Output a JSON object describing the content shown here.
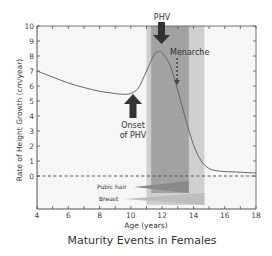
{
  "chart_data": {
    "type": "line",
    "title": "Maturity Events in Females",
    "xlabel": "Age (years)",
    "ylabel": "Rate of Height Growth (cm/year)",
    "xlim": [
      4,
      18
    ],
    "ylim": [
      0,
      10
    ],
    "x_ticks": [
      "4",
      "6",
      "8",
      "10",
      "12",
      "14",
      "16",
      "18"
    ],
    "y_ticks": [
      "0",
      "1",
      "2",
      "3",
      "4",
      "5",
      "6",
      "7",
      "8",
      "9",
      "10"
    ],
    "grid": false,
    "series": [
      {
        "name": "Height growth velocity",
        "x": [
          4,
          5,
          6,
          7,
          8,
          9,
          9.5,
          10,
          10.5,
          11,
          11.5,
          11.8,
          12,
          12.5,
          13,
          13.5,
          14,
          14.5,
          15,
          15.5,
          16,
          17,
          18
        ],
        "y": [
          7.0,
          6.6,
          6.2,
          5.9,
          5.65,
          5.5,
          5.45,
          5.5,
          5.9,
          7.0,
          8.1,
          8.3,
          8.2,
          7.4,
          5.7,
          3.8,
          2.1,
          1.0,
          0.5,
          0.35,
          0.3,
          0.25,
          0.2
        ]
      }
    ],
    "reference_line": {
      "y": 0,
      "style": "dashed"
    },
    "bands": [
      {
        "name": "outer-band",
        "x_start": 11.0,
        "x_end": 14.7,
        "color": "#c8c8c8"
      },
      {
        "name": "inner-band",
        "x_start": 11.3,
        "x_end": 13.7,
        "color": "#9a9a9a"
      }
    ],
    "annotations": [
      {
        "text": "PHV",
        "x": 12.0,
        "y": 8.3,
        "arrow": "down-solid"
      },
      {
        "text": "Menarche",
        "x": 12.9,
        "y": 6.0,
        "arrow": "down-dotted"
      },
      {
        "text": "Onset",
        "text2": "of PHV",
        "x": 10.5,
        "y": 5.5,
        "arrow": "up-solid"
      },
      {
        "text": "Pubic hair",
        "type": "wedge",
        "x_start": 10.2,
        "x_end": 13.7
      },
      {
        "text": "Breast",
        "type": "wedge",
        "x_start": 9.6,
        "x_end": 14.7
      }
    ]
  },
  "labels": {
    "title": "Maturity Events in Females",
    "xlabel": "Age (years)",
    "ylabel": "Rate of Height Growth (cm/year)",
    "phv": "PHV",
    "menarche": "Menarche",
    "onset1": "Onset",
    "onset2": "of PHV",
    "pubic_hair": "Pubic hair",
    "breast": "Breast"
  }
}
